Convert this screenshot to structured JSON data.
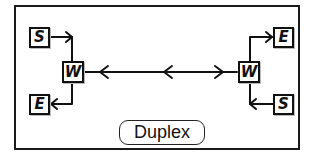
{
  "diagram": {
    "title": "Duplex",
    "left_group": {
      "source": "S",
      "sink": "E",
      "node": "W"
    },
    "right_group": {
      "source": "S",
      "sink": "E",
      "node": "W"
    },
    "link": {
      "type": "bidirectional",
      "arrowheads": [
        "left",
        "left",
        "right"
      ]
    },
    "colors": {
      "stroke": "#111111",
      "background": "#ffffff"
    }
  }
}
